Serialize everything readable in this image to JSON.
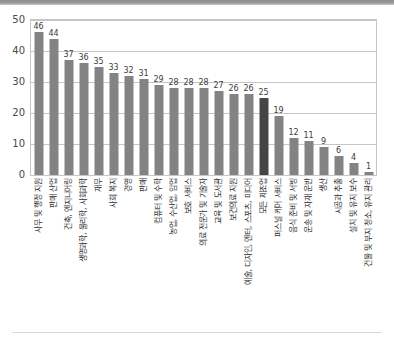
{
  "chart_data": {
    "type": "bar",
    "title": "",
    "subtitle": "",
    "xlabel": "",
    "ylabel": "",
    "ylim": [
      0,
      50
    ],
    "yticks": [
      0,
      10,
      20,
      30,
      40,
      50
    ],
    "grid": true,
    "legend": false,
    "legend_position": "none",
    "bar_color": "#838383",
    "highlight_color": "#464646",
    "highlight_category": "모든 제조업",
    "categories": [
      "사무 및 행정 지원",
      "판매 산업",
      "건축, 엔지니어링",
      "생명과학, 물리학, 사회과학",
      "재무",
      "사회 복지",
      "경영",
      "판매",
      "컴퓨터 및 수학",
      "농업, 수산업, 임업",
      "보호 서비스",
      "의료 전문가 및 기술자",
      "교육 및 도서관",
      "보건의료 지원",
      "예술, 디자인, 엔터, 스포츠, 미디어",
      "모든 제조업",
      "퍼스널 케어 서비스",
      "음식 준비 및 서빙",
      "운송 및 자재 운반",
      "생산",
      "시공과 추출",
      "설치 및 유지 보수",
      "건물 및 부지 청소, 유지 관리"
    ],
    "values": [
      46,
      44,
      37,
      36,
      35,
      33,
      32,
      31,
      29,
      28,
      28,
      28,
      27,
      26,
      26,
      25,
      19,
      12,
      11,
      9,
      6,
      4,
      1
    ]
  }
}
